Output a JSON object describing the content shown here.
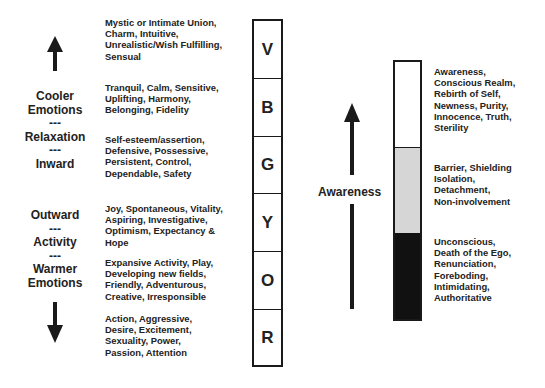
{
  "left_axis": {
    "top_arrow": "up-arrow",
    "bottom_arrow": "down-arrow",
    "upper_labels": [
      "Cooler",
      "Emotions",
      "---",
      "Relaxation",
      "---",
      "Inward"
    ],
    "lower_labels": [
      "Outward",
      "---",
      "Activity",
      "---",
      "Warmer",
      "Emotions"
    ]
  },
  "color_column": {
    "cells": [
      {
        "letter": "V",
        "description": [
          "Mystic or Intimate Union,",
          "Charm, Intuitive,",
          "Unrealistic/Wish Fulfilling,",
          "Sensual"
        ]
      },
      {
        "letter": "B",
        "description": [
          "Tranquil, Calm, Sensitive,",
          "Uplifting, Harmony,",
          "Belonging, Fidelity"
        ]
      },
      {
        "letter": "G",
        "description": [
          "Self-esteem/assertion,",
          "Defensive, Possessive,",
          "Persistent, Control,",
          "Dependable, Safety"
        ]
      },
      {
        "letter": "Y",
        "description": [
          "Joy, Spontaneous, Vitality,",
          "Aspiring, Investigative,",
          "Optimism, Expectancy &",
          "Hope"
        ]
      },
      {
        "letter": "O",
        "description": [
          "Expansive Activity, Play,",
          "Developing new fields,",
          "Friendly, Adventurous,",
          "Creative, Irresponsible"
        ]
      },
      {
        "letter": "R",
        "description": [
          "Action, Aggressive,",
          "Desire, Excitement,",
          "Sexuality, Power,",
          "Passion, Attention"
        ]
      }
    ]
  },
  "awareness": {
    "label": "Awareness",
    "arrow": "up-arrow",
    "segments": [
      {
        "shade": "white",
        "color": "#ffffff",
        "description": [
          "Awareness,",
          "Conscious Realm,",
          "Rebirth of Self,",
          "Newness, Purity,",
          "Innocence, Truth,",
          "Sterility"
        ]
      },
      {
        "shade": "gray",
        "color": "#d6d6d6",
        "description": [
          "Barrier, Shielding",
          "Isolation,",
          "Detachment,",
          "Non-involvement"
        ]
      },
      {
        "shade": "black",
        "color": "#111111",
        "description": [
          "Unconscious,",
          "Death of the Ego,",
          "Renunciation,",
          "Foreboding,",
          "Intimidating,",
          "Authoritative"
        ]
      }
    ]
  }
}
